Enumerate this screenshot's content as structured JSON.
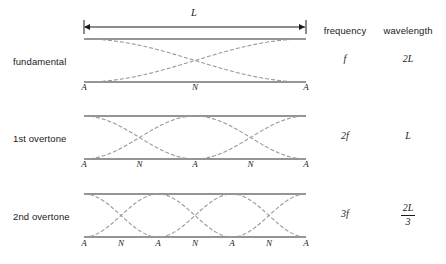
{
  "figure": {
    "title_label": "L",
    "length_arrow": {
      "label": "L",
      "x_start": 84,
      "x_end": 306,
      "y": 27
    },
    "columns": [
      {
        "name": "frequency",
        "label": "frequency",
        "center_x": 345
      },
      {
        "name": "wavelength",
        "label": "wavelength",
        "center_x": 408
      }
    ],
    "geometry": {
      "string_left": 84,
      "string_right": 306,
      "string_color": "#2a2a2a",
      "curve_color": "#9a9a9a",
      "curve_dash": "4 2"
    },
    "rows": [
      {
        "name": "fundamental",
        "label": "fundamental",
        "frequency": "f",
        "wavelength": "2L",
        "wavelength_is_fraction": false,
        "harmonic": 1,
        "top_y": 39,
        "bottom_y": 82,
        "label_y": 63,
        "value_y": 60,
        "markers_y": 89,
        "markers": [
          "A",
          "N",
          "A"
        ]
      },
      {
        "name": "first-overtone",
        "label": "1st overtone",
        "frequency": "2f",
        "wavelength": "L",
        "wavelength_is_fraction": false,
        "harmonic": 2,
        "top_y": 116,
        "bottom_y": 159,
        "label_y": 140,
        "value_y": 137,
        "markers_y": 166,
        "markers": [
          "A",
          "N",
          "A",
          "N",
          "A"
        ]
      },
      {
        "name": "second-overtone",
        "label": "2nd overtone",
        "frequency": "3f",
        "wavelength": {
          "numerator": "2L",
          "denominator": "3"
        },
        "wavelength_is_fraction": true,
        "harmonic": 3,
        "top_y": 194,
        "bottom_y": 237,
        "label_y": 218,
        "value_y": 215,
        "markers_y": 245,
        "markers": [
          "A",
          "N",
          "A",
          "N",
          "A",
          "N",
          "A"
        ]
      }
    ]
  }
}
